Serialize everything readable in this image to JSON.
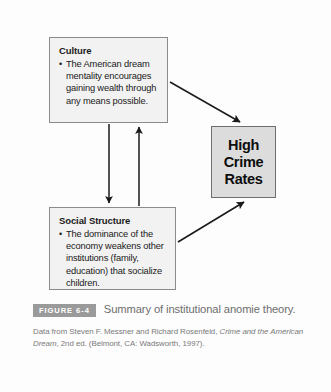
{
  "figure": {
    "badge": "FIGURE 6-4",
    "caption": "Summary of institutional anomie theory.",
    "source_prefix": "Data from Steven F. Messner and Richard Rosenfeld, ",
    "source_italic": "Crime and the American Dream",
    "source_suffix": ", 2nd ed. (Belmont, CA: Wadsworth, 1997)."
  },
  "colors": {
    "box_fill": "#f2f2f2",
    "box_border": "#8b8b8b",
    "crime_fill": "#dcdcdc",
    "crime_border": "#6e6e6e",
    "arrow": "#1a1a1a",
    "badge_bg": "#9a9a9a",
    "caption_text": "#6d6d6d"
  },
  "nodes": {
    "culture": {
      "title": "Culture",
      "bullet_marker": "•",
      "bullet": "The American dream mentality encourages gaining wealth through any means possible."
    },
    "social_structure": {
      "title": "Social Structure",
      "bullet_marker": "•",
      "bullet": "The dominance of the economy weakens other institutions (family, education) that socialize children."
    },
    "crime": {
      "label": "High Crime Rates"
    }
  },
  "arrows": [
    {
      "name": "culture-to-social",
      "from": "Culture",
      "to": "Social Structure",
      "direction": "down"
    },
    {
      "name": "social-to-culture",
      "from": "Social Structure",
      "to": "Culture",
      "direction": "up"
    },
    {
      "name": "culture-to-crime",
      "from": "Culture",
      "to": "High Crime Rates",
      "direction": "diagonal-down-right"
    },
    {
      "name": "social-to-crime",
      "from": "Social Structure",
      "to": "High Crime Rates",
      "direction": "diagonal-up-right"
    }
  ]
}
